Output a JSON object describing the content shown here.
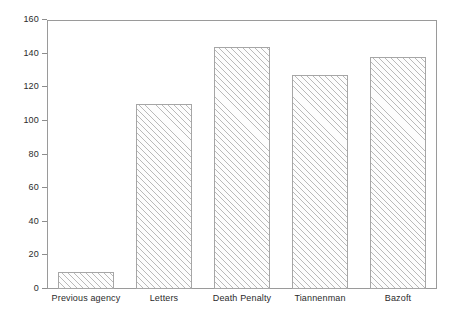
{
  "chart_data": {
    "type": "bar",
    "title": "",
    "subtitle": "",
    "xlabel": "",
    "ylabel": "",
    "categories": [
      "Previous agency",
      "Letters",
      "Death Penalty",
      "Tiannenman",
      "Bazoft"
    ],
    "values": [
      10,
      110,
      144,
      127,
      138
    ],
    "ylim": [
      0,
      160
    ],
    "yticks": [
      0,
      20,
      40,
      60,
      80,
      100,
      120,
      140,
      160
    ],
    "ytick_labels": [
      "0",
      "20",
      "40",
      "60",
      "80",
      "100",
      "120",
      "140",
      "160"
    ],
    "grid": false,
    "legend": null,
    "legend_position": "none",
    "annotations": [],
    "series": [
      {
        "name": "",
        "values": [
          10,
          110,
          144,
          127,
          138
        ]
      }
    ]
  },
  "style": {
    "bar_fill": "#fdfdfd",
    "bar_hatch_color": "#b9b9b9",
    "bar_hatch": "diagonal-forward",
    "bar_border": "#a6a6a6",
    "frame_color": "#9a9a9a",
    "tick_color": "#8d8d8d",
    "text_color": "#2b2b2b",
    "background": "#ffffff"
  }
}
